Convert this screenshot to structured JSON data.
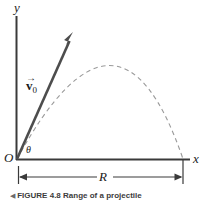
{
  "figure": {
    "type": "physics-diagram",
    "caption_marker": "◀",
    "caption_label": "FIGURE 4.8",
    "caption_text": "Range of a projectile",
    "background_color": "#ffffff",
    "ink_color": "#3a3a3a",
    "vector_color": "#4a4a4a",
    "trajectory_color": "#8e8e8e"
  },
  "axes": {
    "y_label": "y",
    "x_label": "x",
    "origin_label": "O",
    "y_axis": {
      "x": 16,
      "y_top": 16,
      "y_bottom": 160
    },
    "x_axis": {
      "y": 160,
      "x_left": 16,
      "x_right": 190
    }
  },
  "vector": {
    "symbol": "v",
    "arrow_accent": "→",
    "subscript": "0",
    "label_text": "v⃗0",
    "angle_label": "θ",
    "tail": {
      "x": 17,
      "y": 159
    },
    "tip": {
      "x": 73,
      "y": 33
    }
  },
  "trajectory": {
    "style": "dashed",
    "launch": {
      "x": 17,
      "y": 159
    },
    "apex": {
      "x": 119,
      "y": 66
    },
    "landing": {
      "x": 183,
      "y": 159
    }
  },
  "dimension": {
    "label": "R",
    "meaning": "range",
    "y": 177,
    "x_start": 18,
    "x_end": 183
  }
}
